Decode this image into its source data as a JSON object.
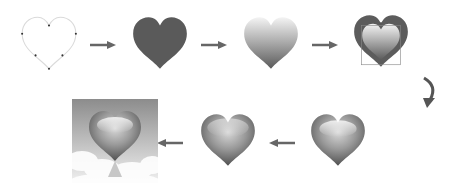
{
  "diagram": {
    "type": "process-flow",
    "steps": [
      {
        "id": 1,
        "name": "outline-path",
        "state": "heart outline with anchor points"
      },
      {
        "id": 2,
        "name": "solid-fill",
        "state": "dark gray solid filled heart"
      },
      {
        "id": 3,
        "name": "gradient-fill",
        "state": "vertical gradient fill, light top to dark bottom"
      },
      {
        "id": 4,
        "name": "inner-highlight",
        "state": "dark outer heart with gradient inner shape and bounding box"
      },
      {
        "id": 5,
        "name": "glossy-heart",
        "state": "glossy shaded heart"
      },
      {
        "id": 6,
        "name": "refined-glossy-heart",
        "state": "glossy heart with softer highlight"
      },
      {
        "id": 7,
        "name": "final-composition",
        "state": "glossy heart over sky background with clouds and reflection"
      }
    ],
    "flow": [
      "1->2",
      "2->3",
      "3->4",
      "4->5 (curved arrow down)",
      "5->6",
      "6->7"
    ]
  },
  "colors": {
    "outline": "#dcdcdc",
    "anchor": "#333333",
    "solid": "#5a5a5a",
    "arrow": "#666666",
    "grad_light": "#f2f2f2",
    "grad_dark": "#5e5e5e",
    "sky_top": "#8f8f8f",
    "sky_bottom": "#e6e6e6"
  }
}
